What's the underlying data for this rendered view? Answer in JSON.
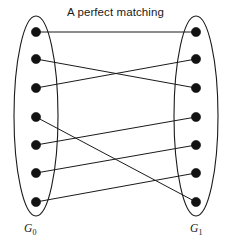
{
  "figure": {
    "title": "A perfect matching",
    "width": 231,
    "height": 246,
    "background": "#ffffff",
    "stroke_color": "#1a1a1a",
    "node_color": "#121212"
  },
  "sets": {
    "left": {
      "name": "G",
      "subscript": "0",
      "label": "G0",
      "node_count": 7,
      "ellipse": {
        "cx": 36,
        "cy": 116,
        "rx": 22,
        "ry": 100
      }
    },
    "right": {
      "name": "G",
      "subscript": "1",
      "label": "G1",
      "node_count": 7,
      "ellipse": {
        "cx": 196,
        "cy": 116,
        "rx": 22,
        "ry": 100
      }
    }
  },
  "graph_data": {
    "type": "bipartite-matching",
    "left_nodes": [
      {
        "id": "L1",
        "x": 36,
        "y": 32
      },
      {
        "id": "L2",
        "x": 36,
        "y": 59
      },
      {
        "id": "L3",
        "x": 36,
        "y": 88
      },
      {
        "id": "L4",
        "x": 36,
        "y": 117
      },
      {
        "id": "L5",
        "x": 36,
        "y": 145
      },
      {
        "id": "L6",
        "x": 36,
        "y": 173
      },
      {
        "id": "L7",
        "x": 36,
        "y": 202
      }
    ],
    "right_nodes": [
      {
        "id": "R1",
        "x": 196,
        "y": 32
      },
      {
        "id": "R2",
        "x": 196,
        "y": 59
      },
      {
        "id": "R3",
        "x": 196,
        "y": 88
      },
      {
        "id": "R4",
        "x": 196,
        "y": 117
      },
      {
        "id": "R5",
        "x": 196,
        "y": 145
      },
      {
        "id": "R6",
        "x": 196,
        "y": 173
      },
      {
        "id": "R7",
        "x": 196,
        "y": 202
      }
    ],
    "node_radius": 4.6,
    "edges": [
      {
        "from": "L1",
        "to": "R1"
      },
      {
        "from": "L2",
        "to": "R3"
      },
      {
        "from": "L3",
        "to": "R2"
      },
      {
        "from": "L4",
        "to": "R7"
      },
      {
        "from": "L5",
        "to": "R4"
      },
      {
        "from": "L6",
        "to": "R5"
      },
      {
        "from": "L7",
        "to": "R6"
      }
    ]
  }
}
